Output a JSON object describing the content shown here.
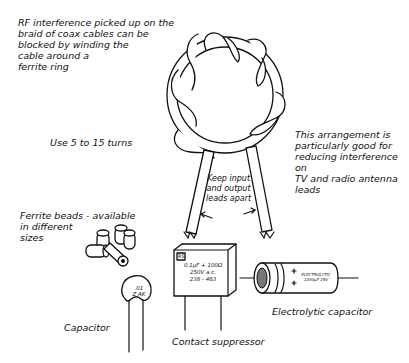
{
  "diagram": {
    "intro_text": "RF interference picked up on the\nbraid of coax cables can be\nblocked by winding the\ncable around a\nferrite ring",
    "turns_note": "Use 5 to 15 turns",
    "arrangement_note": "This arrangement is\nparticularly good for\nreducing interference on\nTV and radio antenna\nleads",
    "leads_note": "Keep input\nand output\nleads apart",
    "ferrite_beads_label": "Ferrite beads - available\nin different\nsizes",
    "capacitor_label": "Capacitor",
    "capacitor_marking": ".01\nZ AK",
    "suppressor_label": "Contact suppressor",
    "suppressor_marking_brand": "RS",
    "suppressor_marking": "0.1µF + 100Ω\n250V a.c.\n238 - 463",
    "electrolytic_label": "Electrolytic capacitor",
    "electrolytic_marking": "ELECTROLYTIC\n2200µF 25V"
  }
}
